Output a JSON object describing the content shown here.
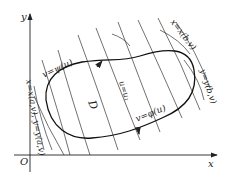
{
  "figure": {
    "axes": {
      "x_label": "x",
      "y_label": "y",
      "origin_label": "O"
    },
    "region_label": "D",
    "curves": {
      "upper_boundary": "v=ψ(u)",
      "lower_boundary": "v=φ(u)",
      "coordinate_line": "u=u₁",
      "left_boundary": "x=x(a,v), y=y(a,v)",
      "right_boundary_x": "x=x(b,v)",
      "right_boundary_y": "y=y(b,v)"
    },
    "colors": {
      "stroke": "#222222",
      "background": "#ffffff"
    }
  }
}
